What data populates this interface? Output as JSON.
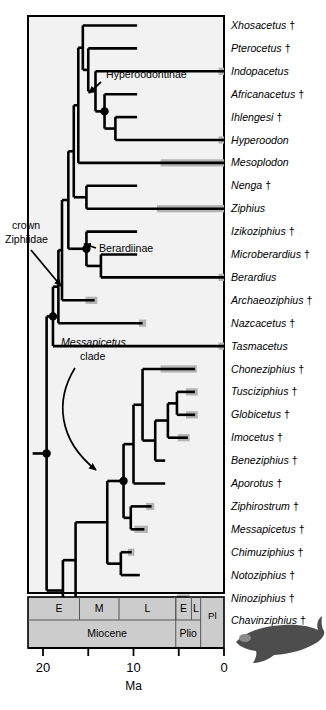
{
  "figure": {
    "axis_unit_label": "Ma",
    "axis_ticks": [
      {
        "value": 20,
        "label": "20"
      },
      {
        "value": 15,
        "label": ""
      },
      {
        "value": 10,
        "label": "10"
      },
      {
        "value": 5,
        "label": ""
      },
      {
        "value": 0,
        "label": "0"
      }
    ],
    "axis_range": [
      20.5,
      0
    ],
    "colors": {
      "branch": "#000000",
      "range_bar": "#b3b3b3",
      "timescale_fill": "#cccccc",
      "timescale_stroke": "#000000",
      "plot_background": "#f2f2f2",
      "whale_silhouette": "#4d4d4d"
    }
  },
  "annotations": [
    {
      "id": "hyperoodontinae",
      "text": "Hyperoodontinae",
      "italic": false
    },
    {
      "id": "crown-ziphiidae",
      "line1": "crown",
      "line2": "Ziphiidae",
      "italic": false
    },
    {
      "id": "berardiinae",
      "text": "Berardiinae",
      "italic": false
    },
    {
      "id": "messapicetus-clade",
      "line1": "Messapicetus",
      "line2": "clade",
      "italic": true
    }
  ],
  "taxa": [
    {
      "i": 0,
      "name": "Xhosacetus",
      "extinct": true,
      "tip_ma": 9.6,
      "range_bar": null
    },
    {
      "i": 1,
      "name": "Pterocetus",
      "extinct": true,
      "tip_ma": 9.6,
      "range_bar": null
    },
    {
      "i": 2,
      "name": "Indopacetus",
      "extinct": false,
      "tip_ma": 0.0,
      "range_bar": [
        0.6,
        0.0
      ]
    },
    {
      "i": 3,
      "name": "Africanacetus",
      "extinct": true,
      "tip_ma": 9.6,
      "range_bar": null
    },
    {
      "i": 4,
      "name": "Ihlengesi",
      "extinct": true,
      "tip_ma": 9.6,
      "range_bar": null
    },
    {
      "i": 5,
      "name": "Hyperoodon",
      "extinct": false,
      "tip_ma": 0.0,
      "range_bar": [
        0.6,
        0.0
      ]
    },
    {
      "i": 6,
      "name": "Mesoplodon",
      "extinct": false,
      "tip_ma": 0.0,
      "range_bar": [
        7.0,
        0.0
      ]
    },
    {
      "i": 7,
      "name": "Nenga",
      "extinct": true,
      "tip_ma": 9.6,
      "range_bar": null
    },
    {
      "i": 8,
      "name": "Ziphius",
      "extinct": false,
      "tip_ma": 0.0,
      "range_bar": [
        7.4,
        0.0
      ]
    },
    {
      "i": 9,
      "name": "Izikoziphius",
      "extinct": true,
      "tip_ma": 9.6,
      "range_bar": null
    },
    {
      "i": 10,
      "name": "Microberardius",
      "extinct": true,
      "tip_ma": 9.6,
      "range_bar": null
    },
    {
      "i": 11,
      "name": "Berardius",
      "extinct": false,
      "tip_ma": 0.0,
      "range_bar": [
        0.6,
        0.0
      ]
    },
    {
      "i": 12,
      "name": "Archaeoziphius",
      "extinct": true,
      "tip_ma": 14.3,
      "range_bar": [
        15.3,
        14.0
      ]
    },
    {
      "i": 13,
      "name": "Nazcacetus",
      "extinct": true,
      "tip_ma": 9.0,
      "range_bar": [
        9.4,
        8.6
      ]
    },
    {
      "i": 14,
      "name": "Tasmacetus",
      "extinct": false,
      "tip_ma": 0.0,
      "range_bar": [
        0.6,
        0.0
      ]
    },
    {
      "i": 15,
      "name": "Choneziphius",
      "extinct": true,
      "tip_ma": 3.2,
      "range_bar": [
        7.0,
        3.0
      ]
    },
    {
      "i": 16,
      "name": "Tusciziphius",
      "extinct": true,
      "tip_ma": 3.2,
      "range_bar": [
        4.2,
        2.9
      ]
    },
    {
      "i": 17,
      "name": "Globicetus",
      "extinct": true,
      "tip_ma": 3.2,
      "range_bar": [
        4.2,
        2.9
      ]
    },
    {
      "i": 18,
      "name": "Imocetus",
      "extinct": true,
      "tip_ma": 4.0,
      "range_bar": [
        5.1,
        3.8
      ]
    },
    {
      "i": 19,
      "name": "Beneziphius",
      "extinct": true,
      "tip_ma": 6.5,
      "range_bar": null
    },
    {
      "i": 20,
      "name": "Aporotus",
      "extinct": true,
      "tip_ma": 6.5,
      "range_bar": null
    },
    {
      "i": 21,
      "name": "Ziphirostrum",
      "extinct": true,
      "tip_ma": 8.0,
      "range_bar": [
        8.6,
        7.7
      ]
    },
    {
      "i": 22,
      "name": "Messapicetus",
      "extinct": true,
      "tip_ma": 8.8,
      "range_bar": [
        9.9,
        8.4
      ]
    },
    {
      "i": 23,
      "name": "Chimuziphius",
      "extinct": true,
      "tip_ma": 10.2,
      "range_bar": [
        10.6,
        9.9
      ]
    },
    {
      "i": 24,
      "name": "Notoziphius",
      "extinct": true,
      "tip_ma": 9.3,
      "range_bar": null
    },
    {
      "i": 25,
      "name": "Ninoziphius",
      "extinct": true,
      "tip_ma": 4.1,
      "range_bar": [
        5.2,
        3.8
      ]
    },
    {
      "i": 26,
      "name": "Chavinziphius",
      "extinct": true,
      "tip_ma": 9.3,
      "range_bar": [
        9.7,
        9.0
      ]
    }
  ],
  "timescale": {
    "stage_row": [
      {
        "label": "E",
        "from": 23.0,
        "to": 15.97
      },
      {
        "label": "M",
        "from": 15.97,
        "to": 11.6
      },
      {
        "label": "L",
        "from": 11.6,
        "to": 5.33
      },
      {
        "label": "E",
        "from": 5.33,
        "to": 3.6
      },
      {
        "label": "L",
        "from": 3.6,
        "to": 2.58
      }
    ],
    "epoch_row": [
      {
        "label": "Miocene",
        "from": 23.0,
        "to": 5.33
      },
      {
        "label": "Plio",
        "from": 5.33,
        "to": 2.58
      },
      {
        "label": "Pl",
        "from": 2.58,
        "to": 0.0
      }
    ]
  },
  "dagger_symbol": "†"
}
